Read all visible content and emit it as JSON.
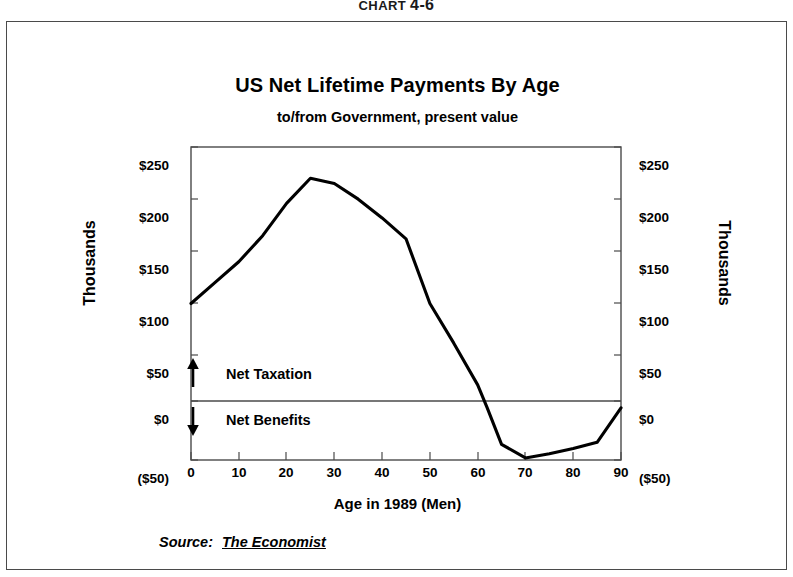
{
  "figure": {
    "caption_prefix": "CHART",
    "caption_number": "4-6"
  },
  "chart_block": {
    "source_label": "Source:",
    "source_value": "The Economist"
  },
  "annotations": {
    "above_zero": {
      "label": "Net Taxation",
      "arrow": "arrow-up-icon"
    },
    "below_zero": {
      "label": "Net Benefits",
      "arrow": "arrow-down-icon"
    }
  },
  "colors": {
    "line": "#000000",
    "axis": "#4a4a4a",
    "frame": "#4a4a4a",
    "background": "#ffffff"
  },
  "chart_data": {
    "type": "line",
    "title": "US Net Lifetime Payments By Age",
    "subtitle": "to/from Government, present value",
    "xlabel": "Age in 1989 (Men)",
    "ylabel": "Thousands",
    "ylabel_right": "Thousands",
    "xlim": [
      0,
      90
    ],
    "ylim": [
      -50,
      250
    ],
    "grid": false,
    "legend": null,
    "xticks": [
      0,
      10,
      20,
      30,
      40,
      50,
      60,
      70,
      80,
      90
    ],
    "xticklabels": [
      "0",
      "10",
      "20",
      "30",
      "40",
      "50",
      "60",
      "70",
      "80",
      "90"
    ],
    "yticks": [
      -50,
      0,
      50,
      100,
      150,
      200,
      250
    ],
    "yticklabels": [
      "($50)",
      "$0",
      "$50",
      "$100",
      "$150",
      "$200",
      "$250"
    ],
    "y_unit": "thousands of dollars",
    "zero_line": 0,
    "series": [
      {
        "name": "Net lifetime payments",
        "x": [
          0,
          5,
          10,
          15,
          20,
          25,
          30,
          35,
          40,
          45,
          50,
          55,
          60,
          62,
          65,
          70,
          75,
          80,
          85,
          90
        ],
        "values": [
          100,
          120,
          140,
          165,
          196,
          220,
          215,
          200,
          182,
          162,
          100,
          62,
          22,
          0,
          -35,
          -48,
          -44,
          -39,
          -33,
          0
        ]
      }
    ]
  }
}
